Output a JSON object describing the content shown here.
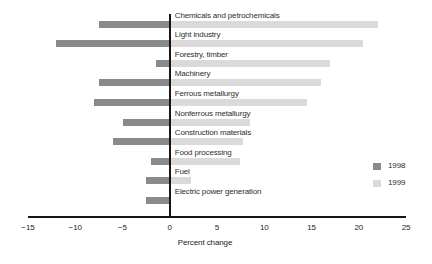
{
  "chart_data": {
    "type": "bar",
    "orientation": "horizontal",
    "categories": [
      "Chemicals and petrochemicals",
      "Light industry",
      "Forestry, timber",
      "Machinery",
      "Ferrous metallurgy",
      "Nonferrous metallurgy",
      "Construction materials",
      "Food processing",
      "Fuel",
      "Electric power generation"
    ],
    "series": [
      {
        "name": "1998",
        "color": "#8a8a8a",
        "values": [
          -7.5,
          -12,
          -1.5,
          -7.5,
          -8,
          -5,
          -6,
          -2,
          -2.5,
          -2.5
        ]
      },
      {
        "name": "1999",
        "color": "#dadada",
        "values": [
          22,
          20.5,
          17,
          16,
          14.5,
          8.5,
          7.7,
          7.4,
          2.3,
          0
        ]
      }
    ],
    "xlabel": "Percent change",
    "xlim": [
      -15,
      25
    ],
    "xticks": [
      -15,
      -10,
      -5,
      0,
      5,
      10,
      15,
      20,
      25
    ],
    "grid": false,
    "legend_position": "right"
  },
  "colors": {
    "axis": "#161616",
    "text": "#2e2e2e",
    "background": "#ffffff"
  }
}
